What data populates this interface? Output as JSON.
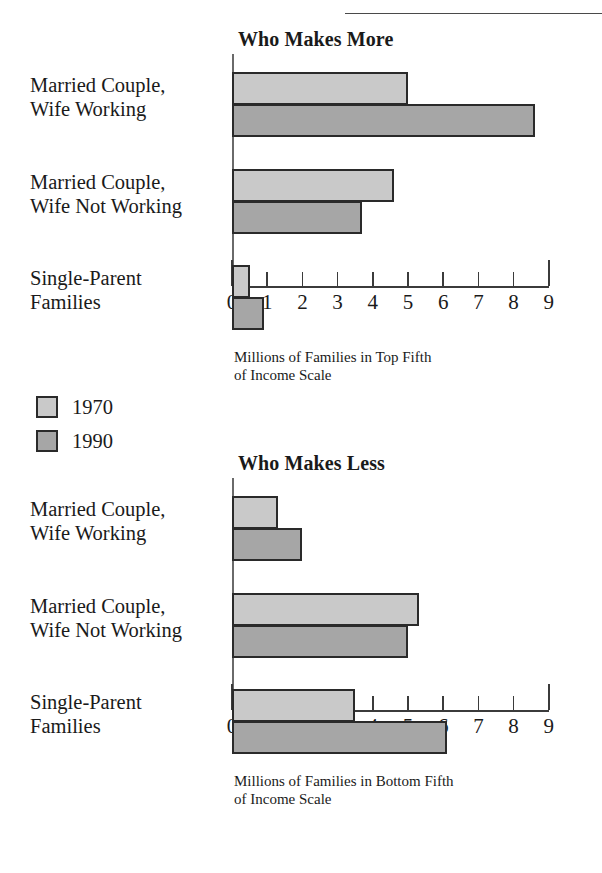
{
  "legend": {
    "items": [
      {
        "label": "1970",
        "color": "#c9c9c9"
      },
      {
        "label": "1990",
        "color": "#a6a6a6"
      }
    ]
  },
  "charts": [
    {
      "title": "Who Makes More",
      "axis_caption_line1": "Millions of Families in Top Fifth",
      "axis_caption_line2": "of Income Scale"
    },
    {
      "title": "Who Makes Less",
      "axis_caption_line1": "Millions of Families in Bottom Fifth",
      "axis_caption_line2": "of Income Scale"
    }
  ],
  "categories": [
    {
      "line1": "Married Couple,",
      "line2": "Wife Working"
    },
    {
      "line1": "Married Couple,",
      "line2": "Wife Not Working"
    },
    {
      "line1": "Single-Parent",
      "line2": "Families"
    }
  ],
  "ticks": [
    "0",
    "1",
    "2",
    "3",
    "4",
    "5",
    "6",
    "7",
    "8",
    "9"
  ],
  "chart_data": [
    {
      "type": "bar",
      "orientation": "horizontal",
      "title": "Who Makes More",
      "xlabel": "Millions of Families in Top Fifth of Income Scale",
      "ylabel": "",
      "xlim": [
        0,
        9
      ],
      "grid": false,
      "legend_position": "outside-left-below",
      "categories": [
        "Married Couple, Wife Working",
        "Married Couple, Wife Not Working",
        "Single-Parent Families"
      ],
      "series": [
        {
          "name": "1970",
          "color": "#c9c9c9",
          "values": [
            5.0,
            4.6,
            0.5
          ]
        },
        {
          "name": "1990",
          "color": "#a6a6a6",
          "values": [
            8.6,
            3.7,
            0.9
          ]
        }
      ]
    },
    {
      "type": "bar",
      "orientation": "horizontal",
      "title": "Who Makes Less",
      "xlabel": "Millions of Families in Bottom Fifth of Income Scale",
      "ylabel": "",
      "xlim": [
        0,
        9
      ],
      "grid": false,
      "legend_position": "outside-left-above",
      "categories": [
        "Married Couple, Wife Working",
        "Married Couple, Wife Not Working",
        "Single-Parent Families"
      ],
      "series": [
        {
          "name": "1970",
          "color": "#c9c9c9",
          "values": [
            1.3,
            5.3,
            3.5
          ]
        },
        {
          "name": "1990",
          "color": "#a6a6a6",
          "values": [
            2.0,
            5.0,
            6.1
          ]
        }
      ]
    }
  ]
}
